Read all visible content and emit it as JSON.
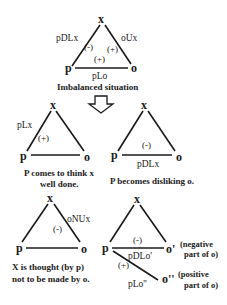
{
  "diagram": {
    "top": {
      "nodes": {
        "x": "x",
        "p": "p",
        "o": "o"
      },
      "edges": {
        "p_x": {
          "label": "pDLx",
          "sign": "(-)"
        },
        "o_x": {
          "label": "oUx",
          "sign": "(+)"
        },
        "p_o": {
          "label": "pLo",
          "sign": "(+)"
        }
      },
      "caption": "Imbalanced situation"
    },
    "arrow": "down-arrow",
    "left_mid": {
      "nodes": {
        "x": "x",
        "p": "p",
        "o": "o"
      },
      "edges": {
        "p_x": {
          "label": "pLx",
          "sign": "(+)"
        }
      },
      "caption_line1": "P comes to think x",
      "caption_line2": "well done."
    },
    "right_mid": {
      "nodes": {
        "x": "x",
        "p": "p",
        "o": "o"
      },
      "edges": {
        "p_o": {
          "label": "pDLx",
          "sign": "(-)"
        }
      },
      "caption": "P becomes disliking o."
    },
    "left_bottom": {
      "nodes": {
        "x": "x",
        "p": "p",
        "o": "o"
      },
      "edges": {
        "o_x": {
          "label": "oNUx",
          "sign": "(-)"
        }
      },
      "caption_line1": "X  is  thought  (by  p)",
      "caption_line2": "not to be made by o."
    },
    "right_bottom": {
      "nodes": {
        "x": "x",
        "p": "p",
        "o1": "o'",
        "o2": "o''"
      },
      "edges": {
        "p_o1": {
          "label": "pDLo'",
          "sign": "(-)"
        },
        "p_o2": {
          "label": "pLo''",
          "sign": "(+)"
        }
      },
      "notes": {
        "o1_line1": "(negative",
        "o1_line2": "part of o)",
        "o2_line1": "(positive",
        "o2_line2": "part of o)"
      }
    }
  }
}
